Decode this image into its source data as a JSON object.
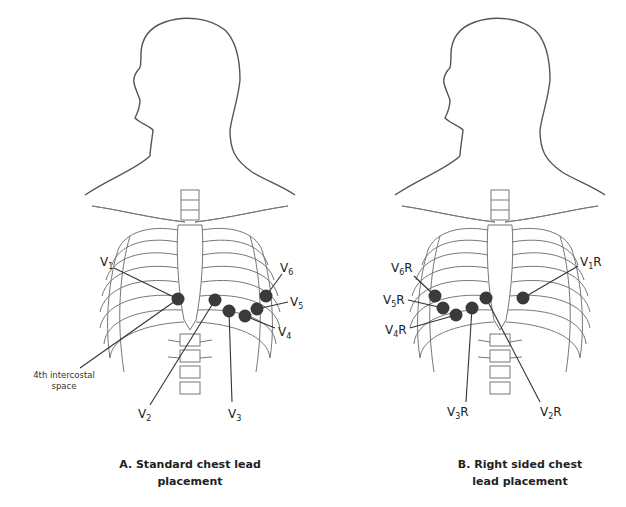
{
  "panels": [
    {
      "id": "A",
      "caption_line1": "A. Standard chest lead",
      "caption_line2": "placement",
      "annotation": {
        "line1": "4th intercostal",
        "line2": "space"
      },
      "leads": [
        {
          "name": "V",
          "sub": "1",
          "suffix": "",
          "dot": [
            178,
            299
          ],
          "label": [
            103,
            268
          ]
        },
        {
          "name": "V",
          "sub": "2",
          "suffix": "",
          "dot": [
            215,
            300
          ],
          "label": [
            140,
            415
          ]
        },
        {
          "name": "V",
          "sub": "3",
          "suffix": "",
          "dot": [
            229,
            311
          ],
          "label": [
            232,
            415
          ]
        },
        {
          "name": "V",
          "sub": "4",
          "suffix": "",
          "dot": [
            245,
            316
          ],
          "label": [
            277,
            333
          ]
        },
        {
          "name": "V",
          "sub": "5",
          "suffix": "",
          "dot": [
            257,
            309
          ],
          "label": [
            290,
            305
          ]
        },
        {
          "name": "V",
          "sub": "6",
          "suffix": "",
          "dot": [
            266,
            296
          ],
          "label": [
            282,
            270
          ]
        }
      ]
    },
    {
      "id": "B",
      "caption_line1": "B. Right sided chest",
      "caption_line2": "lead placement",
      "leads": [
        {
          "name": "V",
          "sub": "1",
          "suffix": "R",
          "dot": [
            523,
            298
          ],
          "label": [
            582,
            268
          ]
        },
        {
          "name": "V",
          "sub": "2",
          "suffix": "R",
          "dot": [
            486,
            298
          ],
          "label": [
            545,
            412
          ]
        },
        {
          "name": "V",
          "sub": "3",
          "suffix": "R",
          "dot": [
            472,
            308
          ],
          "label": [
            445,
            412
          ]
        },
        {
          "name": "V",
          "sub": "4",
          "suffix": "R",
          "dot": [
            456,
            315
          ],
          "label": [
            388,
            332
          ]
        },
        {
          "name": "V",
          "sub": "5",
          "suffix": "R",
          "dot": [
            443,
            308
          ],
          "label": [
            385,
            302
          ]
        },
        {
          "name": "V",
          "sub": "6",
          "suffix": "R",
          "dot": [
            435,
            296
          ],
          "label": [
            393,
            272
          ]
        }
      ]
    }
  ]
}
